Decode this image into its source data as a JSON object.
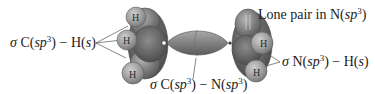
{
  "diagram": {
    "colors": {
      "background": "#ffffff",
      "lobe_dark": "#6b6b6b",
      "lobe_mid": "#8a8a8a",
      "lobe_light": "#a9a9a9",
      "h_sphere": "#9e9e9e",
      "text": "#222222",
      "leader_line": "#555555"
    },
    "atoms": {
      "carbon_hydrogens": [
        "H",
        "H",
        "H"
      ],
      "nitrogen_hydrogens": [
        "H",
        "H"
      ]
    },
    "labels": {
      "c_h_bond": {
        "sigma": "σ",
        "prefix": " C(",
        "orbital_a": "sp",
        "sup_a": "3",
        "mid": ") − H(",
        "orbital_b": "s",
        "suffix": ")"
      },
      "lone_pair": {
        "prefix": "Lone pair in N(",
        "orbital": "sp",
        "sup": "3",
        "suffix": ")"
      },
      "n_h_bond": {
        "sigma": "σ",
        "prefix": " N(",
        "orbital_a": "sp",
        "sup_a": "3",
        "mid": ") − H(",
        "orbital_b": "s",
        "suffix": ")"
      },
      "c_n_bond": {
        "sigma": "σ",
        "prefix": " C(",
        "orbital_a": "sp",
        "sup_a": "3",
        "mid": ") − N(",
        "orbital_b": "sp",
        "sup_b": "3",
        "suffix": ")"
      }
    }
  }
}
